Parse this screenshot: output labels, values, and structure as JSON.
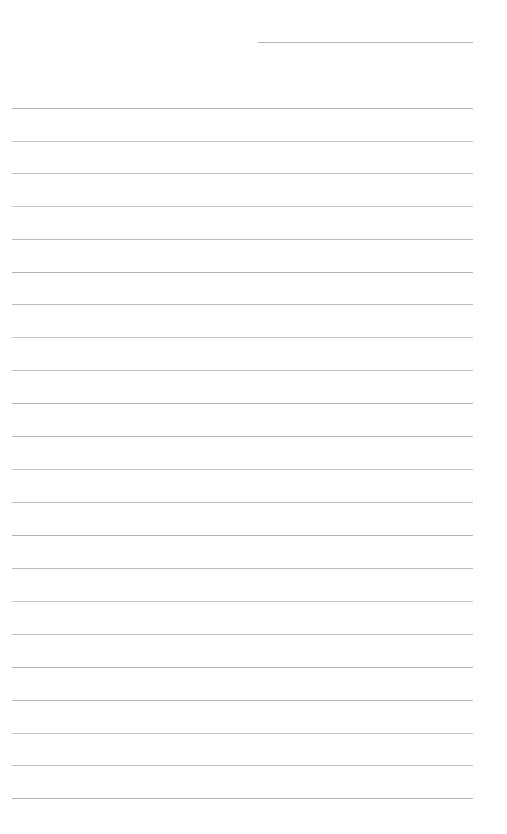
{
  "page": {
    "kind": "ruled-notepad-page",
    "width_px": 507,
    "height_px": 834,
    "background_color": "#ffffff",
    "rule_color": "#b9bdc1",
    "rule_thickness_px": 1,
    "rule_spacing_px": 32.85,
    "content_text": ""
  },
  "layout": {
    "left_margin_px": 12,
    "right_margin_px": 473,
    "first_rule_y_px": 108,
    "last_rule_y_px": 798,
    "header_rule": {
      "label": "header-rule",
      "y_px": 42,
      "x_start_px": 258,
      "x_end_px": 473,
      "value": "",
      "placeholder": ""
    }
  },
  "rules": [
    {
      "index": 1,
      "y": 108,
      "tone": "strong"
    },
    {
      "index": 2,
      "y": 141,
      "tone": "soft"
    },
    {
      "index": 3,
      "y": 173,
      "tone": "normal"
    },
    {
      "index": 4,
      "y": 206,
      "tone": "soft"
    },
    {
      "index": 5,
      "y": 239,
      "tone": "normal"
    },
    {
      "index": 6,
      "y": 272,
      "tone": "strong"
    },
    {
      "index": 7,
      "y": 304,
      "tone": "normal"
    },
    {
      "index": 8,
      "y": 337,
      "tone": "soft"
    },
    {
      "index": 9,
      "y": 370,
      "tone": "normal"
    },
    {
      "index": 10,
      "y": 403,
      "tone": "strong"
    },
    {
      "index": 11,
      "y": 436,
      "tone": "normal"
    },
    {
      "index": 12,
      "y": 469,
      "tone": "soft"
    },
    {
      "index": 13,
      "y": 502,
      "tone": "normal"
    },
    {
      "index": 14,
      "y": 535,
      "tone": "strong"
    },
    {
      "index": 15,
      "y": 568,
      "tone": "normal"
    },
    {
      "index": 16,
      "y": 601,
      "tone": "soft"
    },
    {
      "index": 17,
      "y": 634,
      "tone": "normal"
    },
    {
      "index": 18,
      "y": 667,
      "tone": "strong"
    },
    {
      "index": 19,
      "y": 700,
      "tone": "normal"
    },
    {
      "index": 20,
      "y": 733,
      "tone": "soft"
    },
    {
      "index": 21,
      "y": 765,
      "tone": "normal"
    },
    {
      "index": 22,
      "y": 798,
      "tone": "strong"
    }
  ]
}
